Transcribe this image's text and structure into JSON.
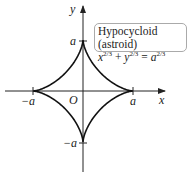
{
  "title": "Hypocycloid (astroid)",
  "equation": {
    "x": "x",
    "y": "y",
    "a": "a",
    "exp": "2/3",
    "plus": " + ",
    "eq": " = "
  },
  "axes": {
    "x_label": "x",
    "y_label": "y",
    "origin_label": "O"
  },
  "ticks": {
    "pos_x": "a",
    "neg_x": "−a",
    "pos_y": "a",
    "neg_y": "−a"
  },
  "colors": {
    "curve": "#111111",
    "axis": "#222222",
    "box_border": "#aaaaaa"
  }
}
